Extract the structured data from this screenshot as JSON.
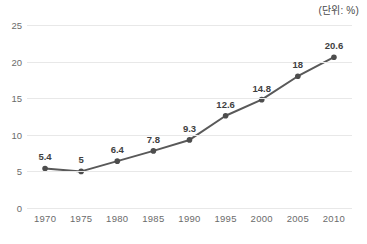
{
  "annotations": {
    "unit_note": "(단위: %)"
  },
  "chart_data": {
    "type": "line",
    "title": "",
    "subtitle": "",
    "xlabel": "",
    "ylabel": "",
    "unit_note": "(단위: %)",
    "categories": [
      "1970",
      "1975",
      "1980",
      "1985",
      "1990",
      "1995",
      "2000",
      "2005",
      "2010"
    ],
    "values": [
      5.4,
      5,
      6.4,
      7.8,
      9.3,
      12.6,
      14.8,
      18,
      20.6
    ],
    "point_labels": [
      "5.4",
      "5",
      "6.4",
      "7.8",
      "9.3",
      "12.6",
      "14.8",
      "18",
      "20.6"
    ],
    "ylim": [
      0,
      25
    ],
    "yticks": [
      0,
      5,
      10,
      15,
      20,
      25
    ],
    "ytick_labels": [
      "0",
      "5",
      "10",
      "15",
      "20",
      "25"
    ],
    "grid": true,
    "grid_axis": "y",
    "legend": false,
    "legend_position": "none",
    "series": [
      {
        "name": "",
        "values": [
          5.4,
          5,
          6.4,
          7.8,
          9.3,
          12.6,
          14.8,
          18,
          20.6
        ]
      }
    ],
    "colors": {
      "line": "#595959",
      "marker": "#4d4d4d",
      "grid": "#e8e8e8",
      "label_text": "#3f3f3f",
      "tick_text": "#6b6b6b",
      "background": "#ffffff"
    },
    "marker_style": "circle",
    "line_width": 2
  }
}
